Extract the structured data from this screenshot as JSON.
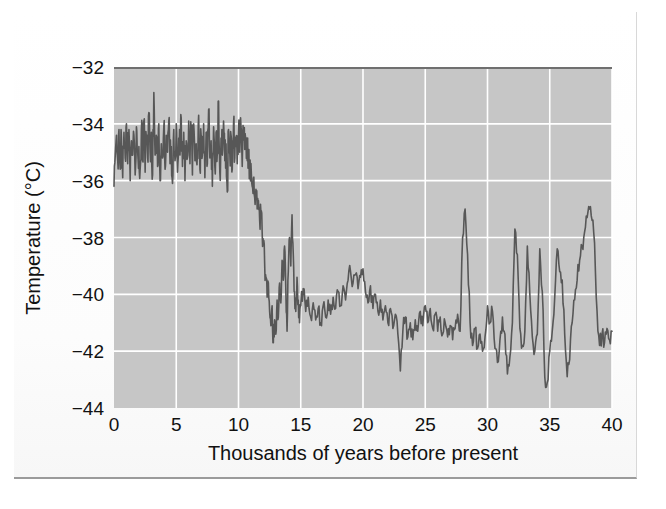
{
  "figure": {
    "background_color": "#fdfdfd",
    "border_color": "#9b9b9b"
  },
  "chart_data": {
    "type": "line",
    "title": "",
    "xlabel": "Thousands of years before present",
    "ylabel": "Temperature (°C)",
    "xlim": [
      0,
      40
    ],
    "ylim": [
      -44,
      -32
    ],
    "xticks": [
      0,
      5,
      10,
      15,
      20,
      25,
      30,
      35,
      40
    ],
    "xtick_labels": [
      "0",
      "5",
      "10",
      "15",
      "20",
      "25",
      "30",
      "35",
      "40"
    ],
    "yticks": [
      -44,
      -42,
      -40,
      -38,
      -36,
      -34,
      -32
    ],
    "ytick_labels": [
      "−44",
      "−42",
      "−40",
      "−38",
      "−36",
      "−34",
      "−32"
    ],
    "grid": true,
    "grid_color": "#ffffff",
    "plot_background_color": "#c6c6c6",
    "legend": null,
    "series": [
      {
        "name": "Greenland ice core temperature",
        "line_color": "#575757",
        "line_width": 1.6,
        "x": [
          0.0,
          0.1,
          0.2,
          0.3,
          0.4,
          0.5,
          0.6,
          0.7,
          0.8,
          0.9,
          1.0,
          1.1,
          1.2,
          1.3,
          1.4,
          1.5,
          1.6,
          1.7,
          1.8,
          1.9,
          2.0,
          2.1,
          2.2,
          2.3,
          2.4,
          2.5,
          2.6,
          2.7,
          2.8,
          2.9,
          3.0,
          3.1,
          3.2,
          3.3,
          3.4,
          3.5,
          3.6,
          3.7,
          3.8,
          3.9,
          4.0,
          4.1,
          4.2,
          4.3,
          4.4,
          4.5,
          4.6,
          4.7,
          4.8,
          4.9,
          5.0,
          5.1,
          5.2,
          5.3,
          5.4,
          5.5,
          5.6,
          5.7,
          5.8,
          5.9,
          6.0,
          6.1,
          6.2,
          6.3,
          6.4,
          6.5,
          6.6,
          6.7,
          6.8,
          6.9,
          7.0,
          7.1,
          7.2,
          7.3,
          7.4,
          7.5,
          7.6,
          7.7,
          7.8,
          7.9,
          8.0,
          8.1,
          8.2,
          8.3,
          8.4,
          8.5,
          8.6,
          8.7,
          8.8,
          8.9,
          9.0,
          9.1,
          9.2,
          9.3,
          9.4,
          9.5,
          9.6,
          9.7,
          9.8,
          9.9,
          10.0,
          10.1,
          10.2,
          10.3,
          10.4,
          10.5,
          10.6,
          10.7,
          10.8,
          10.9,
          11.0,
          11.1,
          11.2,
          11.3,
          11.4,
          11.5,
          11.6,
          11.7,
          11.8,
          11.9,
          12.0,
          12.1,
          12.2,
          12.3,
          12.4,
          12.5,
          12.6,
          12.7,
          12.8,
          12.9,
          13.0,
          13.1,
          13.2,
          13.3,
          13.4,
          13.5,
          13.6,
          13.7,
          13.8,
          13.9,
          14.0,
          14.1,
          14.2,
          14.3,
          14.4,
          14.5,
          14.6,
          14.7,
          14.8,
          14.9,
          15.0,
          15.2,
          15.4,
          15.6,
          15.8,
          16.0,
          16.2,
          16.4,
          16.6,
          16.8,
          17.0,
          17.2,
          17.4,
          17.6,
          17.8,
          18.0,
          18.2,
          18.4,
          18.6,
          18.8,
          19.0,
          19.2,
          19.4,
          19.6,
          19.8,
          20.0,
          20.2,
          20.4,
          20.6,
          20.8,
          21.0,
          21.2,
          21.4,
          21.6,
          21.8,
          22.0,
          22.2,
          22.4,
          22.6,
          22.8,
          23.0,
          23.2,
          23.4,
          23.6,
          23.8,
          24.0,
          24.2,
          24.4,
          24.6,
          24.8,
          25.0,
          25.2,
          25.4,
          25.6,
          25.8,
          26.0,
          26.2,
          26.4,
          26.6,
          26.8,
          27.0,
          27.2,
          27.4,
          27.6,
          27.8,
          28.0,
          28.2,
          28.4,
          28.6,
          28.8,
          29.0,
          29.2,
          29.4,
          29.6,
          29.8,
          30.0,
          30.2,
          30.4,
          30.6,
          30.8,
          31.0,
          31.2,
          31.4,
          31.6,
          31.8,
          32.0,
          32.2,
          32.4,
          32.6,
          32.8,
          33.0,
          33.2,
          33.4,
          33.6,
          33.8,
          34.0,
          34.2,
          34.4,
          34.6,
          34.8,
          35.0,
          35.2,
          35.4,
          35.6,
          35.8,
          36.0,
          36.2,
          36.4,
          36.6,
          36.8,
          37.0,
          37.2,
          37.4,
          37.6,
          37.8,
          38.0,
          38.2,
          38.4,
          38.6,
          38.8,
          39.0,
          39.2,
          39.4,
          39.6,
          39.8,
          40.0
        ],
        "y": [
          -36.2,
          -35.1,
          -34.4,
          -35.3,
          -34.2,
          -35.6,
          -34.5,
          -35.9,
          -34.3,
          -35.2,
          -34.0,
          -35.4,
          -34.2,
          -36.0,
          -34.6,
          -35.1,
          -34.4,
          -35.8,
          -34.1,
          -35.0,
          -34.8,
          -35.6,
          -34.2,
          -35.3,
          -33.9,
          -35.7,
          -34.5,
          -35.2,
          -33.6,
          -35.0,
          -34.3,
          -35.8,
          -32.9,
          -35.1,
          -34.4,
          -35.5,
          -34.0,
          -36.0,
          -34.7,
          -35.2,
          -34.1,
          -35.6,
          -34.4,
          -35.0,
          -33.9,
          -35.4,
          -34.8,
          -36.1,
          -34.2,
          -35.3,
          -34.0,
          -35.7,
          -34.5,
          -35.1,
          -33.8,
          -35.5,
          -34.3,
          -36.0,
          -34.6,
          -35.2,
          -33.9,
          -35.4,
          -34.2,
          -35.8,
          -34.0,
          -35.3,
          -34.7,
          -35.0,
          -33.7,
          -35.6,
          -34.4,
          -35.1,
          -34.0,
          -35.9,
          -34.3,
          -35.4,
          -33.5,
          -35.2,
          -34.6,
          -36.2,
          -34.1,
          -35.5,
          -34.3,
          -35.0,
          -33.2,
          -35.7,
          -34.5,
          -35.1,
          -33.9,
          -35.3,
          -34.7,
          -36.4,
          -34.2,
          -35.0,
          -34.4,
          -35.6,
          -34.0,
          -35.2,
          -34.8,
          -35.4,
          -34.3,
          -35.0,
          -34.1,
          -35.5,
          -34.4,
          -34.9,
          -34.6,
          -35.3,
          -35.0,
          -35.8,
          -35.4,
          -36.2,
          -35.9,
          -36.6,
          -36.3,
          -37.0,
          -36.7,
          -37.4,
          -37.1,
          -37.8,
          -38.2,
          -38.9,
          -39.4,
          -40.1,
          -39.6,
          -40.6,
          -41.1,
          -40.4,
          -41.7,
          -40.9,
          -41.4,
          -40.2,
          -40.8,
          -39.6,
          -40.3,
          -38.8,
          -39.5,
          -38.3,
          -39.8,
          -41.3,
          -39.2,
          -38.0,
          -39.0,
          -37.2,
          -38.6,
          -39.9,
          -40.6,
          -39.4,
          -40.2,
          -41.0,
          -40.4,
          -39.8,
          -40.6,
          -40.1,
          -40.8,
          -40.3,
          -40.9,
          -40.5,
          -41.0,
          -40.4,
          -40.8,
          -40.2,
          -40.7,
          -40.1,
          -40.5,
          -39.9,
          -40.4,
          -39.7,
          -40.2,
          -39.5,
          -39.2,
          -39.6,
          -39.3,
          -39.8,
          -39.4,
          -39.1,
          -39.9,
          -40.3,
          -39.7,
          -40.5,
          -40.0,
          -40.6,
          -40.2,
          -40.9,
          -40.4,
          -41.0,
          -40.5,
          -41.2,
          -40.7,
          -41.4,
          -42.7,
          -41.3,
          -40.8,
          -41.5,
          -41.0,
          -41.6,
          -40.9,
          -41.3,
          -40.6,
          -41.1,
          -40.4,
          -41.0,
          -40.5,
          -41.2,
          -40.7,
          -41.3,
          -40.8,
          -41.4,
          -41.0,
          -41.5,
          -41.1,
          -41.6,
          -41.2,
          -40.7,
          -41.3,
          -38.0,
          -37.0,
          -38.6,
          -41.0,
          -41.8,
          -41.2,
          -41.9,
          -41.4,
          -42.0,
          -41.5,
          -40.4,
          -41.0,
          -40.6,
          -41.9,
          -42.4,
          -41.6,
          -40.8,
          -41.4,
          -42.8,
          -42.2,
          -41.0,
          -37.7,
          -38.6,
          -41.2,
          -41.8,
          -41.3,
          -38.3,
          -40.0,
          -41.5,
          -42.0,
          -41.4,
          -38.4,
          -39.9,
          -42.9,
          -43.1,
          -42.0,
          -41.3,
          -40.1,
          -38.4,
          -39.2,
          -39.5,
          -41.4,
          -42.9,
          -42.3,
          -41.0,
          -40.2,
          -39.5,
          -38.8,
          -38.3,
          -37.8,
          -37.3,
          -37.0,
          -37.4,
          -38.2,
          -40.6,
          -41.8,
          -41.4,
          -41.7,
          -41.2,
          -41.6,
          -41.3
        ]
      }
    ]
  },
  "axes": {
    "x_title": "Thousands of years before present",
    "y_title": "Temperature (°C)"
  }
}
